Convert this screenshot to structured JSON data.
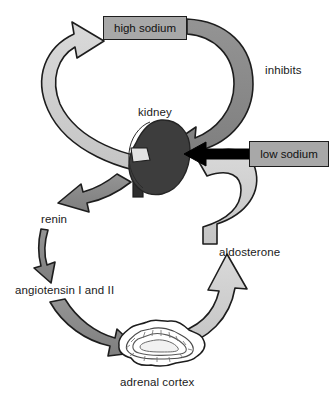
{
  "diagram": {
    "type": "flow-diagram",
    "colors": {
      "light_arrow": "#cccccc",
      "dark_arrow": "#8a8a8a",
      "box_fill": "#a8a8a8",
      "outline": "#1d1d1d",
      "black_arrow": "#000000",
      "kidney_fill": "#3a3a3a",
      "background": "#ffffff"
    },
    "boxes": [
      {
        "id": "high-sodium",
        "label": "high sodium"
      },
      {
        "id": "low-sodium",
        "label": "low sodium"
      }
    ],
    "labels": [
      {
        "id": "inhibits",
        "label": "inhibits"
      },
      {
        "id": "kidney",
        "label": "kidney"
      },
      {
        "id": "renin",
        "label": "renin"
      },
      {
        "id": "angiotensin",
        "label": "angiotensin I and II"
      },
      {
        "id": "aldosterone",
        "label": "aldosterone"
      },
      {
        "id": "adrenal-cortex",
        "label": "adrenal cortex"
      }
    ],
    "organs": [
      {
        "id": "kidney",
        "label": "kidney"
      },
      {
        "id": "adrenal-cortex",
        "label": "adrenal cortex"
      }
    ],
    "arrows": [
      {
        "id": "kidney-to-high-sodium",
        "from": "kidney",
        "to": "high sodium",
        "shade": "light"
      },
      {
        "id": "high-sodium-to-kidney",
        "from": "high sodium",
        "to": "kidney",
        "shade": "dark",
        "annotation": "inhibits"
      },
      {
        "id": "low-sodium-to-kidney",
        "from": "low sodium",
        "to": "kidney",
        "shade": "black"
      },
      {
        "id": "kidney-to-renin",
        "from": "kidney",
        "to": "renin",
        "shade": "dark"
      },
      {
        "id": "renin-to-angiotensin",
        "from": "renin",
        "to": "angiotensin I and II",
        "shade": "dark"
      },
      {
        "id": "angiotensin-to-adrenal-cortex",
        "from": "angiotensin I and II",
        "to": "adrenal cortex",
        "shade": "dark"
      },
      {
        "id": "adrenal-cortex-to-kidney",
        "from": "adrenal cortex",
        "to": "kidney",
        "shade": "light",
        "annotation": "aldosterone"
      }
    ]
  }
}
